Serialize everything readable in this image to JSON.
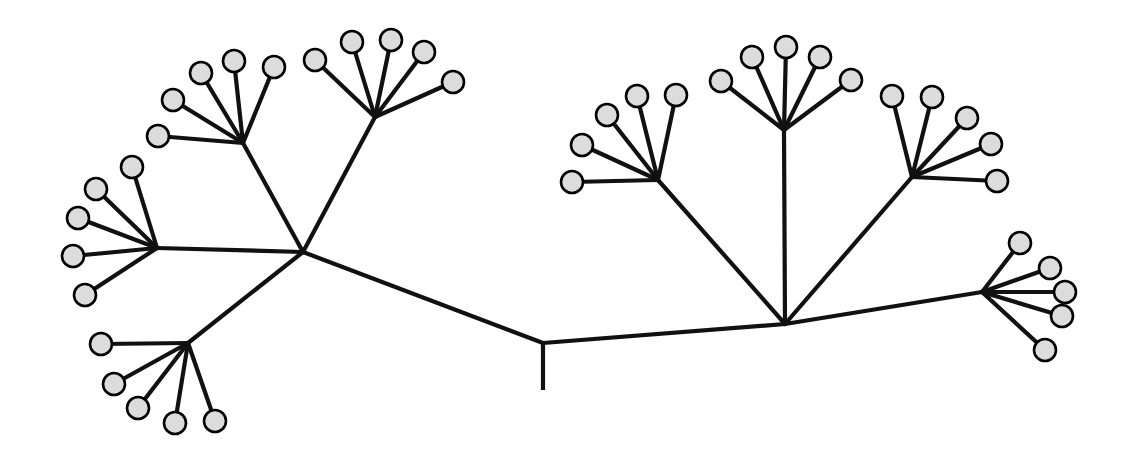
{
  "figure": {
    "type": "radial-tree",
    "background_color": "#ffffff",
    "branch_color": "#111111",
    "leaf_fill_color": "#dcdcdc",
    "leaf_stroke_color": "#000000",
    "leaf_radius": 11,
    "branch_width": 4.2,
    "canvas": {
      "width": 1123,
      "height": 452
    }
  },
  "chart_data": {
    "type": "tree",
    "title": "",
    "leaf_count": 32,
    "internal_node_count": 10,
    "root_stem": {
      "x1": 543,
      "y1": 343,
      "x2": 543,
      "y2": 390
    },
    "nodes": {
      "root": {
        "name": "root",
        "x": 543,
        "y": 343
      },
      "left_hub": {
        "name": "left-main-hub",
        "x": 303,
        "y": 252
      },
      "left_upper_hub": {
        "name": "left-upper-hub",
        "x": 243,
        "y": 143
      },
      "left_upper_right_hub": {
        "name": "left-upper-right-hub",
        "x": 375,
        "y": 117
      },
      "left_mid_hub": {
        "name": "left-middle-fan-hub",
        "x": 157,
        "y": 248
      },
      "left_lower_hub": {
        "name": "left-lower-fan-hub",
        "x": 188,
        "y": 343
      },
      "right_hub": {
        "name": "right-main-hub",
        "x": 785,
        "y": 324
      },
      "right_left_hub": {
        "name": "right-left-fan-hub",
        "x": 658,
        "y": 180
      },
      "right_top_hub": {
        "name": "right-top-fan-hub",
        "x": 784,
        "y": 130
      },
      "right_right_hub": {
        "name": "right-right-fan-hub",
        "x": 912,
        "y": 177
      },
      "far_right_hub": {
        "name": "far-right-fan-hub",
        "x": 982,
        "y": 292
      }
    },
    "internal_edges": [
      {
        "from": "root",
        "to": "left_hub",
        "x1": 543,
        "y1": 343,
        "x2": 303,
        "y2": 252
      },
      {
        "from": "root",
        "to": "right_hub",
        "x1": 543,
        "y1": 343,
        "x2": 785,
        "y2": 324
      },
      {
        "from": "left_hub",
        "to": "left_upper_hub",
        "x1": 303,
        "y1": 252,
        "x2": 243,
        "y2": 143
      },
      {
        "from": "left_hub",
        "to": "left_upper_right_hub",
        "x1": 303,
        "y1": 252,
        "x2": 375,
        "y2": 117
      },
      {
        "from": "left_hub",
        "to": "left_mid_hub",
        "x1": 303,
        "y1": 252,
        "x2": 157,
        "y2": 248
      },
      {
        "from": "left_hub",
        "to": "left_lower_hub",
        "x1": 303,
        "y1": 252,
        "x2": 188,
        "y2": 343
      },
      {
        "from": "right_hub",
        "to": "right_left_hub",
        "x1": 785,
        "y1": 324,
        "x2": 658,
        "y2": 180
      },
      {
        "from": "right_hub",
        "to": "right_top_hub",
        "x1": 785,
        "y1": 324,
        "x2": 784,
        "y2": 130
      },
      {
        "from": "right_hub",
        "to": "right_right_hub",
        "x1": 785,
        "y1": 324,
        "x2": 912,
        "y2": 177
      },
      {
        "from": "right_hub",
        "to": "far_right_hub",
        "x1": 785,
        "y1": 324,
        "x2": 982,
        "y2": 292
      }
    ],
    "clusters": [
      {
        "name": "left-upper-cluster",
        "hub": {
          "x": 243,
          "y": 143
        },
        "leaves": [
          {
            "id": "L1",
            "x": 158,
            "y": 136
          },
          {
            "id": "L2",
            "x": 173,
            "y": 100
          },
          {
            "id": "L3",
            "x": 201,
            "y": 73
          },
          {
            "id": "L4",
            "x": 234,
            "y": 61
          },
          {
            "id": "L5",
            "x": 274,
            "y": 67
          }
        ]
      },
      {
        "name": "left-upper-right-cluster",
        "hub": {
          "x": 375,
          "y": 117
        },
        "leaves": [
          {
            "id": "L6",
            "x": 315,
            "y": 60
          },
          {
            "id": "L7",
            "x": 352,
            "y": 42
          },
          {
            "id": "L8",
            "x": 391,
            "y": 40
          },
          {
            "id": "L9",
            "x": 424,
            "y": 52
          },
          {
            "id": "L10",
            "x": 453,
            "y": 82
          }
        ]
      },
      {
        "name": "left-middle-cluster",
        "hub": {
          "x": 157,
          "y": 248
        },
        "leaves": [
          {
            "id": "L11",
            "x": 132,
            "y": 167
          },
          {
            "id": "L12",
            "x": 96,
            "y": 189
          },
          {
            "id": "L13",
            "x": 78,
            "y": 218
          },
          {
            "id": "L14",
            "x": 73,
            "y": 256
          },
          {
            "id": "L15",
            "x": 85,
            "y": 295
          }
        ]
      },
      {
        "name": "left-lower-cluster",
        "hub": {
          "x": 188,
          "y": 343
        },
        "leaves": [
          {
            "id": "L16",
            "x": 101,
            "y": 344
          },
          {
            "id": "L17",
            "x": 114,
            "y": 384
          },
          {
            "id": "L18",
            "x": 138,
            "y": 408
          },
          {
            "id": "L19",
            "x": 175,
            "y": 423
          },
          {
            "id": "L20",
            "x": 215,
            "y": 421
          }
        ]
      },
      {
        "name": "right-left-cluster",
        "hub": {
          "x": 658,
          "y": 180
        },
        "leaves": [
          {
            "id": "L21",
            "x": 572,
            "y": 182
          },
          {
            "id": "L22",
            "x": 582,
            "y": 145
          },
          {
            "id": "L23",
            "x": 607,
            "y": 115
          },
          {
            "id": "L24",
            "x": 637,
            "y": 96
          },
          {
            "id": "L25",
            "x": 676,
            "y": 95
          }
        ]
      },
      {
        "name": "right-top-cluster",
        "hub": {
          "x": 784,
          "y": 130
        },
        "leaves": [
          {
            "id": "L26",
            "x": 721,
            "y": 81
          },
          {
            "id": "L27",
            "x": 752,
            "y": 57
          },
          {
            "id": "L28",
            "x": 786,
            "y": 47
          },
          {
            "id": "L29",
            "x": 820,
            "y": 57
          },
          {
            "id": "L30",
            "x": 851,
            "y": 80
          }
        ]
      },
      {
        "name": "right-right-cluster",
        "hub": {
          "x": 912,
          "y": 177
        },
        "leaves": [
          {
            "id": "L31",
            "x": 892,
            "y": 96
          },
          {
            "id": "L32",
            "x": 932,
            "y": 97
          },
          {
            "id": "L33",
            "x": 967,
            "y": 118
          },
          {
            "id": "L34",
            "x": 991,
            "y": 144
          },
          {
            "id": "L35",
            "x": 997,
            "y": 181
          }
        ]
      },
      {
        "name": "far-right-cluster",
        "hub": {
          "x": 982,
          "y": 292
        },
        "leaves": [
          {
            "id": "L36",
            "x": 1020,
            "y": 243
          },
          {
            "id": "L37",
            "x": 1050,
            "y": 268
          },
          {
            "id": "L38",
            "x": 1065,
            "y": 292
          },
          {
            "id": "L39",
            "x": 1062,
            "y": 316
          },
          {
            "id": "L40",
            "x": 1045,
            "y": 350
          }
        ]
      }
    ]
  }
}
